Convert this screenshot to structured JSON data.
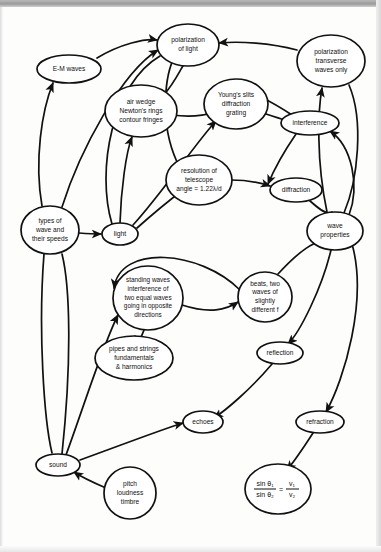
{
  "diagram": {
    "type": "concept-map",
    "stroke_color": "#111111",
    "node_fill": "#ffffff",
    "background": "#fdfdfc",
    "nodes": [
      {
        "id": "em_waves",
        "label": "E-M waves",
        "lines": [
          "E-M waves"
        ],
        "cx": 69,
        "cy": 69,
        "rx": 32,
        "ry": 14,
        "font": 6.6
      },
      {
        "id": "polar_light",
        "label": "polarization of light",
        "lines": [
          "polarization",
          "of light"
        ],
        "cx": 188,
        "cy": 45,
        "rx": 31,
        "ry": 21,
        "font": 6.6
      },
      {
        "id": "polar_trans",
        "label": "polarization transverse waves only",
        "lines": [
          "polarization",
          "transverse",
          "waves only"
        ],
        "cx": 331,
        "cy": 61,
        "rx": 34,
        "ry": 26,
        "font": 6.6
      },
      {
        "id": "air_wedge",
        "label": "air wedge Newton's rings contour fringes",
        "lines": [
          "air wedge",
          "Newton's rings",
          "contour fringes"
        ],
        "cx": 141,
        "cy": 111,
        "rx": 36,
        "ry": 26,
        "font": 6.6
      },
      {
        "id": "youngs_slits",
        "label": "Young's slits diffraction grating",
        "lines": [
          "Young's slits",
          "diffraction",
          "grating"
        ],
        "cx": 236,
        "cy": 104,
        "rx": 32,
        "ry": 25,
        "font": 6.6
      },
      {
        "id": "interference",
        "label": "interference",
        "lines": [
          "interference"
        ],
        "cx": 310,
        "cy": 123,
        "rx": 29,
        "ry": 12,
        "font": 6.6
      },
      {
        "id": "resolution",
        "label": "resolution of telescope angle = 1.22λ/d",
        "lines": [
          "resolution of",
          "telescope",
          "angle = 1.22λ/d"
        ],
        "cx": 199,
        "cy": 180,
        "rx": 33,
        "ry": 25,
        "font": 6.6
      },
      {
        "id": "diffraction",
        "label": "diffraction",
        "lines": [
          "diffraction"
        ],
        "cx": 296,
        "cy": 190,
        "rx": 26,
        "ry": 12,
        "font": 6.6
      },
      {
        "id": "types_wave",
        "label": "types of wave and their speeds",
        "lines": [
          "types of",
          "wave and",
          "their speeds"
        ],
        "cx": 50,
        "cy": 230,
        "rx": 29,
        "ry": 24,
        "font": 6.6
      },
      {
        "id": "light",
        "label": "light",
        "lines": [
          "light"
        ],
        "cx": 120,
        "cy": 234,
        "rx": 18,
        "ry": 11,
        "font": 6.8
      },
      {
        "id": "wave_props",
        "label": "wave properties",
        "lines": [
          "wave",
          "properties"
        ],
        "cx": 335,
        "cy": 231,
        "rx": 28,
        "ry": 19,
        "font": 6.6
      },
      {
        "id": "standing",
        "label": "standing waves interference of two equal waves going in opposite directions",
        "lines": [
          "standing waves",
          "interference of",
          "two equal waves",
          "going in opposite",
          "directions"
        ],
        "cx": 148,
        "cy": 298,
        "rx": 35,
        "ry": 32,
        "font": 6.4
      },
      {
        "id": "beats",
        "label": "beats, two waves of slightly different f",
        "lines": [
          "beats, two",
          "waves of",
          "slightly",
          "different f"
        ],
        "cx": 265,
        "cy": 297,
        "rx": 27,
        "ry": 25,
        "font": 6.5
      },
      {
        "id": "pipes",
        "label": "pipes and strings fundamentals & harmonics",
        "lines": [
          "pipes and strings",
          "fundamentals",
          "& harmonics"
        ],
        "cx": 134,
        "cy": 358,
        "rx": 39,
        "ry": 22,
        "font": 6.6
      },
      {
        "id": "reflection",
        "label": "reflection",
        "lines": [
          "reflection"
        ],
        "cx": 280,
        "cy": 353,
        "rx": 23,
        "ry": 11,
        "font": 6.6
      },
      {
        "id": "echoes",
        "label": "echoes",
        "lines": [
          "echoes"
        ],
        "cx": 203,
        "cy": 422,
        "rx": 20,
        "ry": 11,
        "font": 6.6
      },
      {
        "id": "refraction",
        "label": "refraction",
        "lines": [
          "refraction"
        ],
        "cx": 320,
        "cy": 422,
        "rx": 24,
        "ry": 11,
        "font": 6.6
      },
      {
        "id": "sound",
        "label": "sound",
        "lines": [
          "sound"
        ],
        "cx": 58,
        "cy": 465,
        "rx": 22,
        "ry": 11,
        "font": 6.6
      },
      {
        "id": "pitch",
        "label": "pitch loudness timbre",
        "lines": [
          "pitch",
          "loudness",
          "timbre"
        ],
        "cx": 130,
        "cy": 493,
        "rx": 26,
        "ry": 26,
        "font": 6.6
      },
      {
        "id": "snell",
        "label": "sin θ₁ / sin θ₂ = v₁ / v₂",
        "lines": [],
        "cx": 278,
        "cy": 489,
        "rx": 33,
        "ry": 25,
        "font": 6.6,
        "formula": {
          "num_left": "sin θ₁",
          "den_left": "sin θ₂",
          "equals": "=",
          "num_right": "v₁",
          "den_right": "v₂"
        }
      }
    ],
    "edges": [
      {
        "id": "e1",
        "from": "em_waves",
        "to": "polar_light",
        "path": "M 97 58 C 120 44 146 38 157 40",
        "arrow": true
      },
      {
        "id": "e2",
        "from": "polar_trans",
        "to": "polar_light",
        "path": "M 297 50 C 270 43 240 41 219 43",
        "arrow": true
      },
      {
        "id": "e3",
        "from": "types_wave",
        "to": "em_waves",
        "path": "M 42 206 C 34 160 42 110 53 83",
        "arrow": true
      },
      {
        "id": "e4",
        "from": "types_wave",
        "to": "polar_light",
        "path": "M 62 207 C 80 150 122 72 158 50",
        "arrow": true
      },
      {
        "id": "e5",
        "from": "light",
        "to": "air_wedge",
        "path": "M 120 223 C 121 190 126 152 132 137",
        "arrow": true
      },
      {
        "id": "e6",
        "from": "air_wedge",
        "to": "polar_light",
        "path": "M 163 96 C 175 82 180 70 183 66",
        "arrow": false
      },
      {
        "id": "e7",
        "from": "air_wedge",
        "to": "youngs_slits",
        "path": "M 172 115 C 196 118 212 114 219 110",
        "arrow": false
      },
      {
        "id": "e8",
        "from": "light",
        "to": "youngs_slits",
        "path": "M 133 225 C 160 196 198 140 216 121",
        "arrow": true
      },
      {
        "id": "e9",
        "from": "youngs_slits",
        "to": "interference",
        "path": "M 266 114 C 278 118 285 120 287 121",
        "arrow": false
      },
      {
        "id": "e10",
        "from": "resolution",
        "to": "polar_light",
        "path": "M 177 162 C 158 120 166 72 175 56",
        "arrow": false
      },
      {
        "id": "e11",
        "from": "light",
        "to": "resolution",
        "path": "M 137 228 C 155 212 175 196 183 190",
        "arrow": true
      },
      {
        "id": "e12",
        "from": "resolution",
        "to": "diffraction",
        "path": "M 231 180 C 252 180 264 184 270 186",
        "arrow": true
      },
      {
        "id": "e13",
        "from": "diffraction",
        "to": "wave_props",
        "path": "M 309 200 C 320 210 328 216 332 212",
        "arrow": false
      },
      {
        "id": "e14",
        "from": "interference",
        "to": "diffraction",
        "path": "M 296 134 C 283 153 273 172 268 184",
        "arrow": true
      },
      {
        "id": "e15",
        "from": "wave_props",
        "to": "interference",
        "path": "M 349 215 C 360 186 352 146 330 131",
        "arrow": true
      },
      {
        "id": "e16",
        "from": "polar_trans",
        "to": "wave_props",
        "path": "M 349 85 C 364 120 358 180 344 213",
        "arrow": false
      },
      {
        "id": "e17",
        "from": "wave_props",
        "to": "polar_trans",
        "path": "M 327 212 C 316 160 318 110 322 88",
        "arrow": true
      },
      {
        "id": "e18",
        "from": "types_wave",
        "to": "light",
        "path": "M 79 233 C 92 234 98 234 101 234",
        "arrow": true
      },
      {
        "id": "e19",
        "from": "types_wave",
        "to": "sound",
        "path": "M 44 254 C 38 330 44 420 52 453",
        "arrow": false
      },
      {
        "id": "e20",
        "from": "sound",
        "to": "standing",
        "path": "M 66 455 C 86 400 104 342 118 315",
        "arrow": true
      },
      {
        "id": "e21",
        "from": "standing",
        "to": "beats",
        "path": "M 182 305 C 210 314 226 310 238 302",
        "arrow": true
      },
      {
        "id": "e22",
        "from": "beats",
        "to": "standing",
        "path": "M 240 290 C 200 250 120 244 114 288",
        "arrow": true
      },
      {
        "id": "e23",
        "from": "standing",
        "to": "pipes",
        "path": "M 144 330 C 140 340 137 348 135 336",
        "arrow": false
      },
      {
        "id": "e24",
        "from": "beats",
        "to": "wave_props",
        "path": "M 278 274 C 300 250 316 240 322 243",
        "arrow": false
      },
      {
        "id": "e25",
        "from": "wave_props",
        "to": "reflection",
        "path": "M 331 250 C 322 288 300 332 288 344",
        "arrow": true
      },
      {
        "id": "e26",
        "from": "reflection",
        "to": "echoes",
        "path": "M 272 364 C 250 390 226 410 214 418",
        "arrow": true
      },
      {
        "id": "e27",
        "from": "sound",
        "to": "echoes",
        "path": "M 80 460 C 124 444 166 428 183 423",
        "arrow": true
      },
      {
        "id": "e28",
        "from": "wave_props",
        "to": "refraction",
        "path": "M 352 244 C 368 300 344 380 326 412",
        "arrow": true
      },
      {
        "id": "e29",
        "from": "refraction",
        "to": "snell",
        "path": "M 313 433 C 302 450 292 464 287 470",
        "arrow": true
      },
      {
        "id": "e30",
        "from": "pitch",
        "to": "sound",
        "path": "M 106 488 C 92 482 80 476 74 472",
        "arrow": true
      },
      {
        "id": "e31",
        "from": "sound",
        "to": "types_wave",
        "path": "M 62 454 C 72 360 70 286 62 254",
        "arrow": false
      },
      {
        "id": "e32",
        "from": "interference",
        "to": "youngs_slits",
        "path": "M 292 115 C 270 100 254 94 248 90",
        "arrow": false
      },
      {
        "id": "e33",
        "from": "light",
        "to": "polar_light",
        "path": "M 112 224 C 96 170 112 84 160 56",
        "arrow": false
      }
    ]
  }
}
